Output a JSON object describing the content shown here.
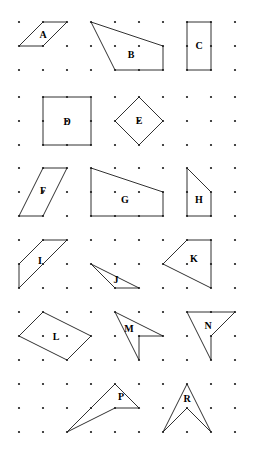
{
  "worksheet": {
    "title": "Dot grid polygon worksheet",
    "background_color": "#ffffff",
    "ink_color": "#1a1a1a",
    "width": 253,
    "height": 460
  },
  "grid": {
    "name": "dot-grid",
    "dot_radius": 1.1,
    "columns_x": [
      19,
      43,
      67,
      91,
      115,
      139,
      163,
      187,
      211,
      235
    ],
    "rows_y": [
      22,
      46,
      70,
      97,
      121,
      145,
      168,
      192,
      216,
      240,
      264,
      288,
      312,
      336,
      360,
      384,
      408,
      432
    ],
    "spacing_x": 24,
    "spacing_y": 24
  },
  "shapes": [
    {
      "id": "A",
      "label": "A",
      "type": "parallelogram",
      "points": "43,22 67,22 43,46 19,46",
      "label_x": 43,
      "label_y": 36
    },
    {
      "id": "B",
      "label": "B",
      "type": "quadrilateral",
      "points": "91,22 163,46 163,70 115,70",
      "label_x": 131,
      "label_y": 56
    },
    {
      "id": "C",
      "label": "C",
      "type": "rectangle",
      "points": "187,22 211,22 211,70 187,70",
      "label_x": 199,
      "label_y": 47
    },
    {
      "id": "D",
      "label": "D",
      "type": "square",
      "points": "43,97 91,97 91,145 43,145",
      "label_x": 67,
      "label_y": 123
    },
    {
      "id": "E",
      "label": "E",
      "type": "diamond",
      "points": "139,97 163,121 139,145 115,121",
      "label_x": 139,
      "label_y": 122
    },
    {
      "id": "F",
      "label": "F",
      "type": "parallelogram",
      "points": "43,168 67,168 43,216 19,216",
      "label_x": 43,
      "label_y": 192
    },
    {
      "id": "G",
      "label": "G",
      "type": "trapezoid",
      "points": "91,168 163,192 163,216 91,216",
      "label_x": 125,
      "label_y": 201
    },
    {
      "id": "H",
      "label": "H",
      "type": "quadrilateral",
      "points": "187,168 211,192 211,216 187,216",
      "label_x": 199,
      "label_y": 201
    },
    {
      "id": "I",
      "label": "I",
      "type": "triangle",
      "points": "43,240 67,240 19,288 19,264",
      "label_x": 40,
      "label_y": 262
    },
    {
      "id": "J",
      "label": "J",
      "type": "triangle",
      "points": "91,264 139,288 115,288",
      "label_x": 116,
      "label_y": 281
    },
    {
      "id": "K",
      "label": "K",
      "type": "quadrilateral",
      "points": "187,240 211,240 211,288 163,264",
      "label_x": 194,
      "label_y": 260
    },
    {
      "id": "L",
      "label": "L",
      "type": "quadrilateral",
      "points": "43,312 91,336 67,360 19,336",
      "label_x": 56,
      "label_y": 338
    },
    {
      "id": "M",
      "label": "M",
      "type": "concave-arrow",
      "points": "115,312 163,336 139,336 139,360",
      "label_x": 129,
      "label_y": 330
    },
    {
      "id": "N",
      "label": "N",
      "type": "concave-arrow",
      "points": "187,312 235,312 211,336 211,360",
      "label_x": 208,
      "label_y": 327
    },
    {
      "id": "P",
      "label": "P",
      "type": "concave-arrow",
      "points": "115,384 139,408 115,408 67,432",
      "label_x": 121,
      "label_y": 398
    },
    {
      "id": "R",
      "label": "R",
      "type": "chevron",
      "points": "187,384 211,432 187,408 163,432",
      "label_x": 187,
      "label_y": 400
    }
  ]
}
